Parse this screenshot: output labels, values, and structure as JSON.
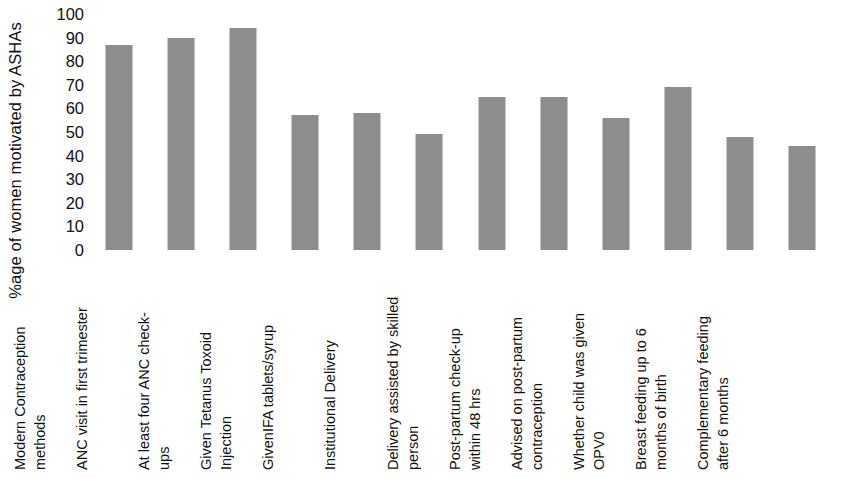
{
  "chart_data": {
    "type": "bar",
    "title": "",
    "subtitle": "",
    "xlabel": "",
    "ylabel": "%age of women motivated by ASHAs",
    "ylim": [
      0,
      100
    ],
    "ytick_step": 10,
    "yticks": [
      "100",
      "90",
      "80",
      "70",
      "60",
      "50",
      "40",
      "30",
      "20",
      "10",
      "0"
    ],
    "grid": false,
    "legend": false,
    "legend_position": "none",
    "bar_color": "#8d8d8d",
    "categories": [
      "Modern Contraception methods",
      "ANC visit in first trimester",
      "At least four ANC check-ups",
      "Given Tetanus Toxoid Injection",
      "GivenIFA tablets/syrup",
      "Institutional Delivery",
      "Delivery assisted by skilled person",
      "Post-partum check-up within 48 hrs",
      "Advised on post-partum contraception",
      "Whether child was given OPV0",
      "Breast feeding up to 6 months of birth",
      "Complementary feeding after 6 months"
    ],
    "category_lines": [
      "Modern Contraception\nmethods",
      "ANC visit in first trimester",
      "At least four ANC check-\nups",
      "Given Tetanus Toxoid\nInjection",
      "GivenIFA tablets/syrup",
      "Institutional Delivery",
      "Delivery assisted by skilled\nperson",
      "Post-partum check-up\nwithin 48 hrs",
      "Advised on post-partum\ncontraception",
      "Whether child was given\nOPV0",
      "Breast feeding up to 6\nmonths of birth",
      "Complementary feeding\nafter 6 months"
    ],
    "values": [
      87,
      90,
      94,
      57,
      58,
      49,
      65,
      65,
      56,
      69,
      48,
      44
    ]
  }
}
